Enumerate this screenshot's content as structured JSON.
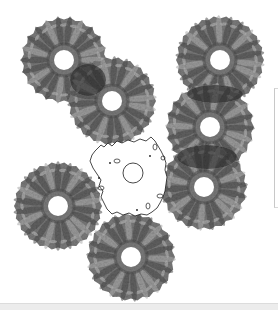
{
  "image": {
    "description": "Seven textured rings arranged around a central empty region outlined by a thin contour, with a small circle at its center",
    "width": 278,
    "height": 310,
    "background": "#ffffff"
  },
  "colors": {
    "ring_base": "#7a7a7a",
    "ring_dark": "#4a4a4a",
    "ring_light": "#b4b4b4",
    "ring_overlap": "#2e2e2e",
    "hole": "#ffffff",
    "contour": "#1a1a1a",
    "bottom_strip": "#ececec",
    "panel_border": "#c8c8c8"
  },
  "rings": [
    {
      "id": "ring-top-left",
      "cx": 64,
      "cy": 60,
      "r": 43,
      "hole": 10
    },
    {
      "id": "ring-upper-center",
      "cx": 112,
      "cy": 101,
      "r": 44,
      "hole": 10
    },
    {
      "id": "ring-top-right",
      "cx": 220,
      "cy": 60,
      "r": 44,
      "hole": 10
    },
    {
      "id": "ring-right-middle",
      "cx": 210,
      "cy": 127,
      "r": 44,
      "hole": 10
    },
    {
      "id": "ring-right-lower",
      "cx": 204,
      "cy": 187,
      "r": 43,
      "hole": 10
    },
    {
      "id": "ring-bottom-left",
      "cx": 58,
      "cy": 206,
      "r": 44,
      "hole": 10
    },
    {
      "id": "ring-bottom-center",
      "cx": 131,
      "cy": 257,
      "r": 44,
      "hole": 10
    }
  ],
  "overlaps": [
    {
      "id": "overlap-1-2",
      "cx": 88,
      "cy": 80,
      "rx": 18,
      "ry": 16
    },
    {
      "id": "overlap-3-4",
      "cx": 215,
      "cy": 94,
      "rx": 28,
      "ry": 9
    },
    {
      "id": "overlap-4-5",
      "cx": 207,
      "cy": 157,
      "rx": 30,
      "ry": 12
    }
  ],
  "center_marker": {
    "cx": 133,
    "cy": 173,
    "r": 10
  },
  "contour": {
    "path": "M 98 148 L 101 145 L 104 147 L 108 143 L 112 146 L 117 141 L 122 143 L 128 140 L 134 142 L 140 139 L 146 141 L 151 137 L 155 141 L 158 146 L 161 151 L 164 157 L 166 163 L 165 170 L 167 177 L 166 184 L 165 191 L 163 197 L 160 203 L 157 208 L 152 212 L 147 215 L 141 214 L 135 216 L 129 213 L 123 215 L 117 212 L 112 214 L 107 209 L 104 203 L 101 197 L 103 191 L 99 186 L 101 180 L 97 174 L 93 168 L 90 161 L 92 155 L 95 151 Z",
    "islands": [
      {
        "cx": 117,
        "cy": 161,
        "rx": 3,
        "ry": 2
      },
      {
        "cx": 101,
        "cy": 188,
        "rx": 3,
        "ry": 2
      },
      {
        "cx": 155,
        "cy": 147,
        "rx": 2,
        "ry": 3
      },
      {
        "cx": 163,
        "cy": 158,
        "rx": 2,
        "ry": 2
      },
      {
        "cx": 160,
        "cy": 196,
        "rx": 3,
        "ry": 2
      },
      {
        "cx": 148,
        "cy": 206,
        "rx": 2,
        "ry": 3
      }
    ],
    "dots": [
      {
        "cx": 99,
        "cy": 178
      },
      {
        "cx": 137,
        "cy": 210
      },
      {
        "cx": 110,
        "cy": 163
      },
      {
        "cx": 150,
        "cy": 156
      }
    ]
  },
  "ui": {
    "side_panel_visible": true,
    "bottom_strip_visible": true
  }
}
